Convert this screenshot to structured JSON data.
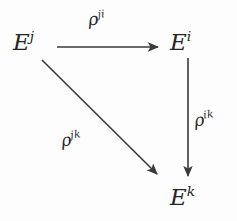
{
  "diagram": {
    "type": "commutative-diagram",
    "background_color": "#fdfdfd",
    "stroke_color": "#3a3a3a",
    "text_color": "#262626",
    "nodes": [
      {
        "id": "ej",
        "base": "E",
        "superscript": "j",
        "text": "E^j",
        "x": 30,
        "y": 46
      },
      {
        "id": "ei",
        "base": "E",
        "superscript": "i",
        "text": "E^i",
        "x": 188,
        "y": 46
      },
      {
        "id": "ek",
        "base": "E",
        "superscript": "k",
        "text": "E^k",
        "x": 188,
        "y": 200
      }
    ],
    "edges": [
      {
        "id": "top",
        "from": "ej",
        "to": "ei",
        "label_base": "ρ",
        "label_superscript": "ji",
        "label_text": "ρ^{ji}",
        "x1": 57,
        "y1": 47,
        "x2": 160,
        "y2": 47
      },
      {
        "id": "vertical",
        "from": "ei",
        "to": "ek",
        "label_base": "ρ",
        "label_superscript": "ik",
        "label_text": "ρ^{ik}",
        "x1": 188,
        "y1": 58,
        "x2": 188,
        "y2": 178
      },
      {
        "id": "diagonal",
        "from": "ej",
        "to": "ek",
        "label_base": "ρ",
        "label_superscript": "jk",
        "label_text": "ρ^{jk}",
        "x1": 42,
        "y1": 60,
        "x2": 159,
        "y2": 176
      }
    ]
  }
}
